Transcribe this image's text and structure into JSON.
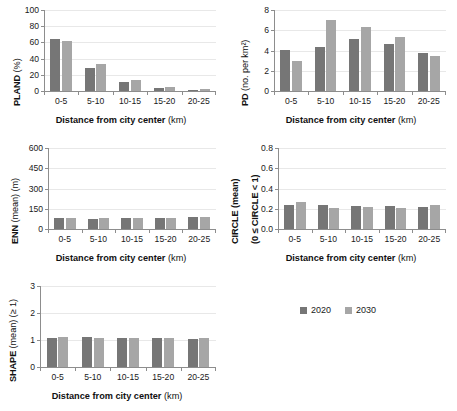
{
  "legend": {
    "position": "bottom-right",
    "entries": [
      {
        "label": "2020",
        "color": "#767676"
      },
      {
        "label": "2030",
        "color": "#a6a6a6"
      }
    ]
  },
  "shared": {
    "xlabel_bold": "Distance from city center",
    "xlabel_unit": "(km)",
    "categories": [
      "0-5",
      "5-10",
      "10-15",
      "15-20",
      "20-25"
    ]
  },
  "chart_data": [
    {
      "id": "pland",
      "type": "bar",
      "title": "",
      "ylabel": "PLAND (%)",
      "ylabel_bold": "PLAND",
      "ylabel_unit": "(%)",
      "xlabel": "Distance from city center (km)",
      "categories": [
        "0-5",
        "5-10",
        "10-15",
        "15-20",
        "20-25"
      ],
      "ylim": [
        0,
        100
      ],
      "yticks": [
        0,
        20,
        40,
        60,
        80,
        100
      ],
      "grid": true,
      "series": [
        {
          "name": "2020",
          "color": "#767676",
          "values": [
            64,
            28,
            11,
            3.5,
            1.5
          ]
        },
        {
          "name": "2030",
          "color": "#a6a6a6",
          "values": [
            62,
            33,
            13,
            4.5,
            3
          ]
        }
      ]
    },
    {
      "id": "pd",
      "type": "bar",
      "title": "",
      "ylabel": "PD (no. per km²)",
      "ylabel_bold": "PD",
      "ylabel_unit": "(no. per km²)",
      "xlabel": "Distance from city center (km)",
      "categories": [
        "0-5",
        "5-10",
        "10-15",
        "15-20",
        "20-25"
      ],
      "ylim": [
        0,
        8
      ],
      "yticks": [
        0,
        2,
        4,
        6,
        8
      ],
      "grid": true,
      "series": [
        {
          "name": "2020",
          "color": "#767676",
          "values": [
            4.05,
            4.35,
            5.15,
            4.65,
            3.8
          ]
        },
        {
          "name": "2030",
          "color": "#a6a6a6",
          "values": [
            2.95,
            7.05,
            6.35,
            5.3,
            3.5
          ]
        }
      ]
    },
    {
      "id": "enn",
      "type": "bar",
      "title": "",
      "ylabel": "ENN (mean) (m)",
      "ylabel_bold": "ENN",
      "ylabel_unit": "(mean) (m)",
      "xlabel": "Distance from city center (km)",
      "categories": [
        "0-5",
        "5-10",
        "10-15",
        "15-20",
        "20-25"
      ],
      "ylim": [
        0,
        600
      ],
      "yticks": [
        0,
        150,
        300,
        450,
        600
      ],
      "grid": true,
      "series": [
        {
          "name": "2020",
          "color": "#767676",
          "values": [
            78,
            77,
            78,
            78,
            88
          ]
        },
        {
          "name": "2030",
          "color": "#a6a6a6",
          "values": [
            78,
            78,
            80,
            78,
            92
          ]
        }
      ]
    },
    {
      "id": "circle",
      "type": "bar",
      "title": "",
      "ylabel": "CIRCLE (mean) (0 ≤ CIRCLE < 1)",
      "ylabel_bold": "CIRCLE (mean)",
      "ylabel_unit": "(0 ≤ CIRCLE < 1)",
      "xlabel": "Distance from city center (km)",
      "categories": [
        "0-5",
        "5-10",
        "10-15",
        "15-20",
        "20-25"
      ],
      "ylim": [
        0,
        0.8
      ],
      "yticks": [
        "0.0",
        "0.2",
        "0.4",
        "0.6",
        "0.8"
      ],
      "grid": true,
      "series": [
        {
          "name": "2020",
          "color": "#767676",
          "values": [
            0.24,
            0.24,
            0.23,
            0.23,
            0.22
          ]
        },
        {
          "name": "2030",
          "color": "#a6a6a6",
          "values": [
            0.27,
            0.21,
            0.22,
            0.21,
            0.24
          ]
        }
      ]
    },
    {
      "id": "shape",
      "type": "bar",
      "title": "",
      "ylabel": "SHAPE (mean) (≥ 1)",
      "ylabel_bold": "SHAPE",
      "ylabel_unit": "(mean) (≥ 1)",
      "xlabel": "Distance from city center (km)",
      "categories": [
        "0-5",
        "5-10",
        "10-15",
        "15-20",
        "20-25"
      ],
      "ylim": [
        0,
        3
      ],
      "yticks": [
        0,
        1,
        2,
        3
      ],
      "grid": true,
      "series": [
        {
          "name": "2020",
          "color": "#767676",
          "values": [
            1.09,
            1.1,
            1.09,
            1.06,
            1.05
          ]
        },
        {
          "name": "2030",
          "color": "#a6a6a6",
          "values": [
            1.13,
            1.07,
            1.07,
            1.07,
            1.09
          ]
        }
      ]
    }
  ]
}
